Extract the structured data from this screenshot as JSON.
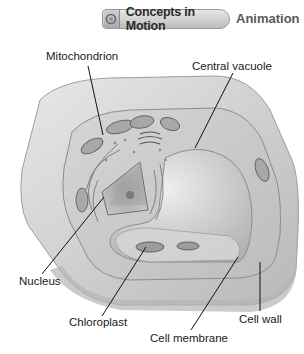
{
  "header": {
    "badge_label": "Concepts in Motion",
    "badge_icon": "motion-circle-icon",
    "secondary_label": "Animation"
  },
  "diagram": {
    "labels": [
      {
        "id": "mitochondrion",
        "text": "Mitochondrion"
      },
      {
        "id": "central-vacuole",
        "text": "Central vacuole"
      },
      {
        "id": "nucleus",
        "text": "Nucleus"
      },
      {
        "id": "chloroplast",
        "text": "Chloroplast"
      },
      {
        "id": "cell-membrane",
        "text": "Cell membrane"
      },
      {
        "id": "cell-wall",
        "text": "Cell wall"
      }
    ]
  },
  "colors": {
    "badge_fill": "#c8c8c8",
    "cell_wall": "#dcdcdc",
    "cytoplasm": "#cfcfcf",
    "vacuole": "#d8d8d8",
    "label_text": "#1a1a1a"
  }
}
